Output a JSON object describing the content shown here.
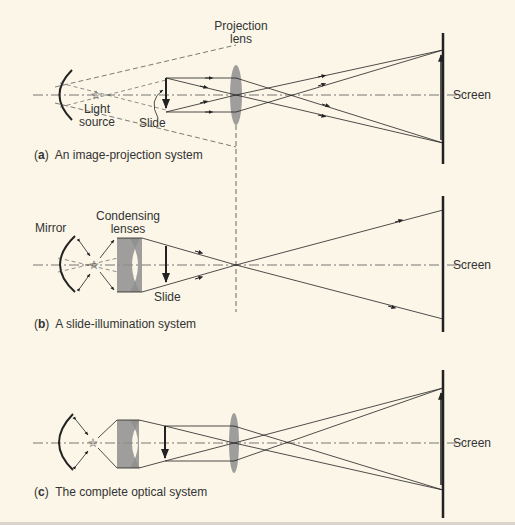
{
  "figure": {
    "panels": [
      {
        "id": "a",
        "caption_letter": "a",
        "caption_text": "An image-projection system",
        "labels": {
          "projection_lens": "Projection\nlens",
          "light_source": "Light\nsource",
          "slide": "Slide",
          "screen": "Screen"
        }
      },
      {
        "id": "b",
        "caption_letter": "b",
        "caption_text": "A slide-illumination system",
        "labels": {
          "mirror": "Mirror",
          "condensing_lenses": "Condensing\nlenses",
          "slide": "Slide",
          "screen": "Screen"
        }
      },
      {
        "id": "c",
        "caption_letter": "c",
        "caption_text": "The complete optical system",
        "labels": {
          "screen": "Screen"
        }
      }
    ],
    "colors": {
      "background": "#fbf6e8",
      "ink": "#222222",
      "lens_fill": "#8e8e8e",
      "axis": "#555555"
    }
  }
}
